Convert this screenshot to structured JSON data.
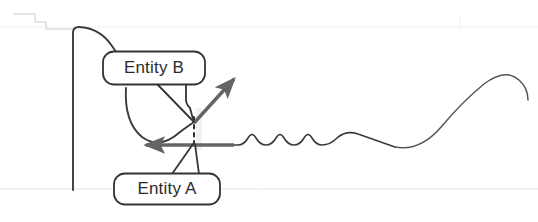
{
  "figure": {
    "type": "annotated-line-diagram",
    "background_color": "#ffffff",
    "stroke_color": "#3a3a3a",
    "faint_guide_color": "#e4e4e6",
    "arrow_color": "#646464",
    "callout_fill": "#ffffff",
    "callout_stroke": "#333333",
    "text_color": "#2b2b2b"
  },
  "callouts": [
    {
      "id": "entity-b",
      "label": "Entity B",
      "x": 154,
      "y": 68,
      "width": 102,
      "height": 33
    },
    {
      "id": "entity-a",
      "label": "Entity A",
      "x": 167,
      "y": 189,
      "width": 106,
      "height": 31
    }
  ],
  "arrows": [
    {
      "id": "diagonal-arrow",
      "direction": "up-right",
      "from_x": 194,
      "from_y": 123,
      "to_x": 238,
      "to_y": 75
    },
    {
      "id": "horizontal-arrow",
      "direction": "left",
      "from_x": 228,
      "from_y": 145,
      "to_x": 141,
      "to_y": 145
    }
  ],
  "markers": [
    {
      "id": "dashed-connector",
      "style": "dashed-vertical",
      "x": 194,
      "y_top": 118,
      "y_bottom": 143
    }
  ],
  "guides": [
    {
      "id": "baseline-guide",
      "orientation": "horizontal",
      "y": 189
    },
    {
      "id": "top-guide",
      "orientation": "horizontal",
      "y": 27
    },
    {
      "id": "step-guide",
      "orientation": "stepped",
      "note": "faint stepped line top-left"
    }
  ]
}
